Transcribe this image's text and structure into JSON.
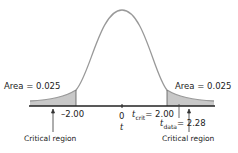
{
  "figure": {
    "left_area_label": "Area = 0.025",
    "right_area_label": "Area = 0.025",
    "left_tick_label": "–2.00",
    "zero_tick_label": "0",
    "axis_variable": "t",
    "tcrit_symbol": "t",
    "tcrit_sub": "crit",
    "tcrit_value": "= 2.00",
    "tdata_symbol": "t",
    "tdata_sub": "data",
    "tdata_value": "= 2.28",
    "left_region_label": "Critical region",
    "right_region_label": "Critical region",
    "colors": {
      "shade": "#c8c8c8",
      "curve": "#999999",
      "axis": "#222222"
    }
  }
}
